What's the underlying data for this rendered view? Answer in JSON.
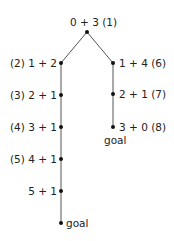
{
  "diagram": {
    "type": "search-tree",
    "edge_color": "#555555",
    "node_color": "#111111",
    "nodes": [
      {
        "id": "root",
        "label": "0 + 3  (1)",
        "x": 87,
        "y": 32
      },
      {
        "id": "n2",
        "label": "(2)  1 + 2",
        "x": 61,
        "y": 63
      },
      {
        "id": "n3",
        "label": "(3)  2 + 1",
        "x": 61,
        "y": 95
      },
      {
        "id": "n4",
        "label": "(4)  3 + 1",
        "x": 61,
        "y": 127
      },
      {
        "id": "n5",
        "label": "(5)  4 + 1",
        "x": 61,
        "y": 159
      },
      {
        "id": "n5b",
        "label": "5 + 1",
        "x": 61,
        "y": 191
      },
      {
        "id": "goal-left",
        "label": "goal",
        "x": 61,
        "y": 223
      },
      {
        "id": "n6",
        "label": "1 + 4  (6)",
        "x": 113,
        "y": 63
      },
      {
        "id": "n7",
        "label": "2 + 1  (7)",
        "x": 113,
        "y": 94
      },
      {
        "id": "n8",
        "label": "3 + 0  (8)",
        "x": 113,
        "y": 127
      },
      {
        "id": "goal-right",
        "label": "goal",
        "x": 113,
        "y": 141
      }
    ],
    "edges": [
      [
        "root",
        "n2"
      ],
      [
        "root",
        "n6"
      ],
      [
        "n2",
        "n3"
      ],
      [
        "n3",
        "n4"
      ],
      [
        "n4",
        "n5"
      ],
      [
        "n5",
        "n5b"
      ],
      [
        "n5b",
        "goal-left"
      ],
      [
        "n6",
        "n7"
      ],
      [
        "n7",
        "n8"
      ]
    ]
  }
}
